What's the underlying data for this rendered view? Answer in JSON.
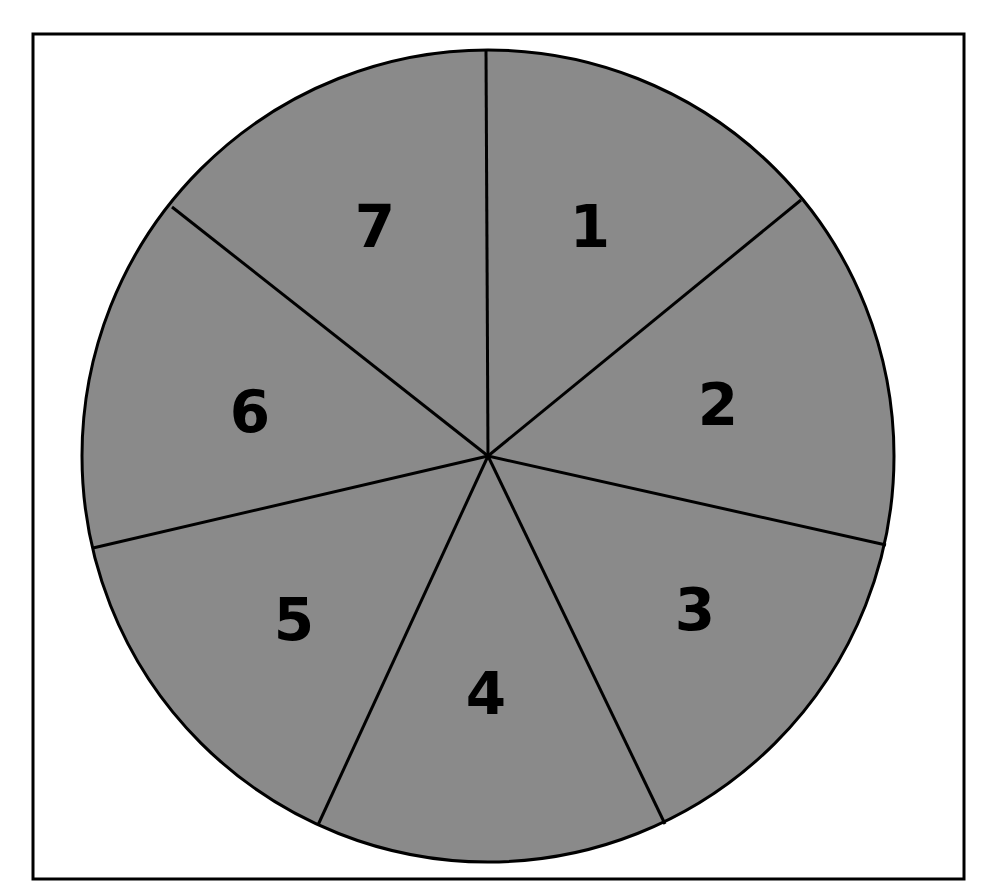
{
  "diagram": {
    "type": "pie-wheel",
    "colors": {
      "sector_fill": "#8a8a8a",
      "stroke": "#000000",
      "background": "#ffffff"
    },
    "box": {
      "x": 33,
      "y": 34,
      "width": 931,
      "height": 845
    },
    "circle": {
      "cx": 488,
      "cy": 456,
      "r": 406
    },
    "sectors": [
      {
        "label": "1",
        "x": 590,
        "y": 247
      },
      {
        "label": "2",
        "x": 718,
        "y": 425
      },
      {
        "label": "3",
        "x": 695,
        "y": 630
      },
      {
        "label": "4",
        "x": 486,
        "y": 714
      },
      {
        "label": "5",
        "x": 294,
        "y": 640
      },
      {
        "label": "6",
        "x": 250,
        "y": 432
      },
      {
        "label": "7",
        "x": 375,
        "y": 247
      }
    ],
    "spokes": [
      [
        486,
        50
      ],
      [
        801,
        200
      ],
      [
        886,
        545
      ],
      [
        665,
        824
      ],
      [
        318,
        825
      ],
      [
        93,
        548
      ],
      [
        172,
        207
      ]
    ]
  }
}
